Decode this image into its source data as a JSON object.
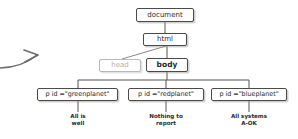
{
  "diagram": {
    "type": "dom-tree",
    "title": "",
    "background_color": "#ffffff",
    "line_color": "#555555",
    "muted_color": "#b2b2b2",
    "nodes": [
      {
        "id": "document",
        "label": "document",
        "state": "normal"
      },
      {
        "id": "html",
        "label": "html",
        "state": "normal"
      },
      {
        "id": "head",
        "label": "head",
        "state": "muted"
      },
      {
        "id": "body",
        "label": "body",
        "state": "normal"
      },
      {
        "id": "p-green",
        "label": "p id =\"greenplanet\"",
        "state": "normal"
      },
      {
        "id": "p-red",
        "label": "p id =\"redplanet\"",
        "state": "normal"
      },
      {
        "id": "p-blue",
        "label": "p id =\"blueplanet\"",
        "state": "normal"
      }
    ],
    "leaf_text": [
      {
        "id": "text-green",
        "label": "All is\nwell"
      },
      {
        "id": "text-red",
        "label": "Nothing to\nreport"
      },
      {
        "id": "text-blue",
        "label": "All systems\nA-OK"
      }
    ],
    "annotation": {
      "arrow": "curved-arrow-right"
    }
  }
}
